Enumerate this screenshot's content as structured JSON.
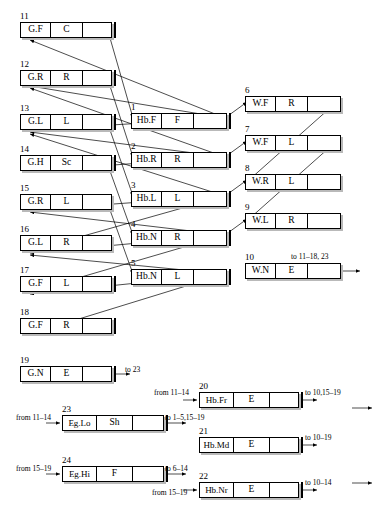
{
  "figure": {
    "header_faint": "",
    "nodes": [
      {
        "id": "1",
        "cells": [
          "Hb.F",
          "F",
          ""
        ],
        "x": 131,
        "y": 113,
        "w": 96,
        "idx_x": 131,
        "idx_y": 103,
        "endbar": true
      },
      {
        "id": "2",
        "cells": [
          "Hb.R",
          "R",
          ""
        ],
        "x": 131,
        "y": 152,
        "w": 96,
        "idx_x": 131,
        "idx_y": 142,
        "endbar": true
      },
      {
        "id": "3",
        "cells": [
          "Hb.L",
          "L",
          ""
        ],
        "x": 131,
        "y": 191,
        "w": 96,
        "idx_x": 131,
        "idx_y": 181,
        "endbar": true
      },
      {
        "id": "4",
        "cells": [
          "Hb.N",
          "R",
          ""
        ],
        "x": 131,
        "y": 230,
        "w": 96,
        "idx_x": 131,
        "idx_y": 220,
        "endbar": true
      },
      {
        "id": "5",
        "cells": [
          "Hb.N",
          "L",
          ""
        ],
        "x": 131,
        "y": 269,
        "w": 96,
        "idx_x": 131,
        "idx_y": 259,
        "endbar": true
      },
      {
        "id": "6",
        "cells": [
          "W.F",
          "R",
          ""
        ],
        "x": 245,
        "y": 96,
        "w": 96,
        "idx_x": 245,
        "idx_y": 86,
        "endbar": false
      },
      {
        "id": "7",
        "cells": [
          "W.F",
          "L",
          ""
        ],
        "x": 245,
        "y": 135,
        "w": 96,
        "idx_x": 245,
        "idx_y": 125,
        "endbar": false
      },
      {
        "id": "8",
        "cells": [
          "W.R",
          "L",
          ""
        ],
        "x": 245,
        "y": 174,
        "w": 96,
        "idx_x": 245,
        "idx_y": 164,
        "endbar": false
      },
      {
        "id": "9",
        "cells": [
          "W.L",
          "R",
          ""
        ],
        "x": 245,
        "y": 213,
        "w": 96,
        "idx_x": 245,
        "idx_y": 203,
        "endbar": false
      },
      {
        "id": "10",
        "cells": [
          "W.N",
          "E",
          ""
        ],
        "x": 245,
        "y": 263,
        "w": 96,
        "idx_x": 245,
        "idx_y": 253,
        "endbar": false
      },
      {
        "id": "11",
        "cells": [
          "G.F",
          "C",
          ""
        ],
        "x": 20,
        "y": 22,
        "w": 92,
        "idx_x": 20,
        "idx_y": 12,
        "endbar": true
      },
      {
        "id": "12",
        "cells": [
          "G.R",
          "R",
          ""
        ],
        "x": 20,
        "y": 70,
        "w": 92,
        "idx_x": 20,
        "idx_y": 60,
        "endbar": true
      },
      {
        "id": "13",
        "cells": [
          "G.L",
          "L",
          ""
        ],
        "x": 20,
        "y": 114,
        "w": 92,
        "idx_x": 20,
        "idx_y": 104,
        "endbar": true
      },
      {
        "id": "14",
        "cells": [
          "G.H",
          "Sc",
          ""
        ],
        "x": 20,
        "y": 155,
        "w": 92,
        "idx_x": 20,
        "idx_y": 145,
        "endbar": true
      },
      {
        "id": "15",
        "cells": [
          "G.R",
          "L",
          ""
        ],
        "x": 20,
        "y": 194,
        "w": 92,
        "idx_x": 20,
        "idx_y": 184,
        "endbar": false
      },
      {
        "id": "16",
        "cells": [
          "G.L",
          "R",
          ""
        ],
        "x": 20,
        "y": 235,
        "w": 92,
        "idx_x": 20,
        "idx_y": 225,
        "endbar": false
      },
      {
        "id": "17",
        "cells": [
          "G.F",
          "L",
          ""
        ],
        "x": 20,
        "y": 276,
        "w": 92,
        "idx_x": 20,
        "idx_y": 266,
        "endbar": true
      },
      {
        "id": "18",
        "cells": [
          "G.F",
          "R",
          ""
        ],
        "x": 20,
        "y": 318,
        "w": 92,
        "idx_x": 20,
        "idx_y": 308,
        "endbar": true
      },
      {
        "id": "19",
        "cells": [
          "G.N",
          "E",
          ""
        ],
        "x": 20,
        "y": 366,
        "w": 92,
        "idx_x": 20,
        "idx_y": 356,
        "endbar": true
      },
      {
        "id": "23",
        "cells": [
          "Eg.Lo",
          "Sh",
          ""
        ],
        "x": 62,
        "y": 415,
        "w": 102,
        "idx_x": 62,
        "idx_y": 405,
        "endbar": true,
        "wide": true
      },
      {
        "id": "24",
        "cells": [
          "Eg.Hi",
          "F",
          ""
        ],
        "x": 62,
        "y": 466,
        "w": 102,
        "idx_x": 62,
        "idx_y": 456,
        "endbar": true,
        "wide": true
      },
      {
        "id": "20",
        "cells": [
          "Hb.Fr",
          "E",
          ""
        ],
        "x": 199,
        "y": 392,
        "w": 100,
        "idx_x": 199,
        "idx_y": 382,
        "endbar": true,
        "wide": true
      },
      {
        "id": "21",
        "cells": [
          "Hb.Md",
          "E",
          ""
        ],
        "x": 199,
        "y": 437,
        "w": 100,
        "idx_x": 199,
        "idx_y": 427,
        "endbar": true,
        "wide": true
      },
      {
        "id": "22",
        "cells": [
          "Hb.Nr",
          "E",
          ""
        ],
        "x": 199,
        "y": 482,
        "w": 100,
        "idx_x": 199,
        "idx_y": 472,
        "endbar": true,
        "wide": true
      }
    ],
    "annotations": [
      {
        "id": "to-10",
        "text": "to 11–18, 23",
        "x": 291,
        "y": 253
      },
      {
        "id": "to-19",
        "text": "to 23",
        "x": 125,
        "y": 366
      },
      {
        "id": "from-23",
        "text": "from 11–14",
        "x": 16,
        "y": 414
      },
      {
        "id": "to-23",
        "text": "to 1–5,15–19",
        "x": 165,
        "y": 414
      },
      {
        "id": "from-24",
        "text": "from 15–19",
        "x": 16,
        "y": 465
      },
      {
        "id": "to-24",
        "text": "to 6–14",
        "x": 165,
        "y": 465
      },
      {
        "id": "from-20",
        "text": "from 11–14",
        "x": 154,
        "y": 389
      },
      {
        "id": "to-20",
        "text": "to 10,15–19",
        "x": 305,
        "y": 389
      },
      {
        "id": "to-21",
        "text": "to 10–19",
        "x": 305,
        "y": 434
      },
      {
        "id": "from-22",
        "text": "from 15–19",
        "x": 152,
        "y": 489
      },
      {
        "id": "to-22",
        "text": "to 10–14",
        "x": 305,
        "y": 479
      }
    ],
    "edges": [
      {
        "from": "1",
        "to": "11"
      },
      {
        "from": "1",
        "to": "12"
      },
      {
        "from": "1",
        "to": "13"
      },
      {
        "from": "2",
        "to": "12"
      },
      {
        "from": "2",
        "to": "13"
      },
      {
        "from": "2",
        "to": "14"
      },
      {
        "from": "3",
        "to": "13"
      },
      {
        "from": "3",
        "to": "15"
      },
      {
        "from": "3",
        "to": "16"
      },
      {
        "from": "4",
        "to": "15"
      },
      {
        "from": "4",
        "to": "16"
      },
      {
        "from": "4",
        "to": "17"
      },
      {
        "from": "5",
        "to": "16"
      },
      {
        "from": "5",
        "to": "17"
      },
      {
        "from": "5",
        "to": "18"
      },
      {
        "from": "11",
        "to": "1"
      },
      {
        "from": "12",
        "to": "2"
      },
      {
        "from": "13",
        "to": "3"
      },
      {
        "from": "14",
        "to": "4"
      },
      {
        "from": "15",
        "to": "5"
      },
      {
        "from": "6",
        "to": "8"
      },
      {
        "from": "7",
        "to": "9"
      },
      {
        "from": "1",
        "to": "6"
      },
      {
        "from": "2",
        "to": "7"
      },
      {
        "from": "3",
        "to": "8"
      },
      {
        "from": "4",
        "to": "9"
      }
    ]
  }
}
